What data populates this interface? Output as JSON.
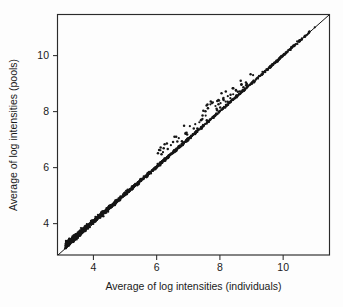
{
  "figure": {
    "background_color": "#fdfdfd",
    "ink_color": "#1a1a1a"
  },
  "chart_data": {
    "type": "scatter",
    "title": "",
    "xlabel": "Average of log intensities (individuals)",
    "ylabel": "Average of log intensities (pools)",
    "xlim": [
      2.88,
      11.45
    ],
    "ylim": [
      2.88,
      11.45
    ],
    "xticks": [
      4,
      6,
      8,
      10
    ],
    "yticks": [
      4,
      6,
      8,
      10
    ],
    "xtick_labels": [
      "4",
      "6",
      "8",
      "10"
    ],
    "ytick_labels": [
      "4",
      "6",
      "8",
      "10"
    ],
    "grid": false,
    "legend": null,
    "point_color": "#161616",
    "point_size": 1.1,
    "reference_line": {
      "name": "identity-line",
      "slope": 1,
      "intercept": 0,
      "x_from": 2.88,
      "x_to": 11.45,
      "color": "#111111"
    },
    "series": [
      {
        "name": "probes",
        "n_points": 1400,
        "points": [
          [
            3.1,
            3.12
          ],
          [
            3.18,
            3.2
          ],
          [
            3.25,
            3.28
          ],
          [
            3.32,
            3.35
          ],
          [
            3.38,
            3.41
          ],
          [
            3.44,
            3.47
          ],
          [
            3.5,
            3.54
          ],
          [
            3.55,
            3.6
          ],
          [
            3.6,
            3.66
          ],
          [
            3.64,
            3.71
          ],
          [
            3.68,
            3.75
          ],
          [
            3.72,
            3.8
          ],
          [
            3.75,
            3.84
          ],
          [
            3.78,
            3.88
          ],
          [
            3.81,
            3.91
          ],
          [
            3.84,
            3.94
          ],
          [
            3.87,
            3.97
          ],
          [
            3.9,
            4.0
          ],
          [
            3.93,
            4.03
          ],
          [
            3.96,
            4.06
          ],
          [
            3.99,
            4.09
          ],
          [
            4.02,
            4.12
          ],
          [
            4.05,
            4.15
          ],
          [
            4.08,
            4.18
          ],
          [
            4.11,
            4.21
          ],
          [
            4.14,
            4.24
          ],
          [
            4.17,
            4.27
          ],
          [
            4.2,
            4.3
          ],
          [
            4.23,
            4.33
          ],
          [
            4.26,
            4.36
          ],
          [
            4.29,
            4.39
          ],
          [
            4.32,
            4.42
          ],
          [
            4.35,
            4.45
          ],
          [
            4.38,
            4.48
          ],
          [
            4.41,
            4.51
          ],
          [
            4.44,
            4.54
          ],
          [
            4.47,
            4.56
          ],
          [
            4.5,
            4.59
          ],
          [
            4.53,
            4.62
          ],
          [
            4.56,
            4.65
          ],
          [
            4.59,
            4.68
          ],
          [
            4.62,
            4.71
          ],
          [
            4.65,
            4.74
          ],
          [
            4.68,
            4.77
          ],
          [
            4.71,
            4.8
          ],
          [
            4.74,
            4.82
          ],
          [
            4.77,
            4.85
          ],
          [
            4.8,
            4.88
          ],
          [
            4.83,
            4.91
          ],
          [
            4.86,
            4.94
          ],
          [
            4.9,
            4.97
          ],
          [
            4.94,
            5.01
          ],
          [
            4.98,
            5.05
          ],
          [
            5.02,
            5.09
          ],
          [
            5.06,
            5.13
          ],
          [
            5.1,
            5.17
          ],
          [
            5.14,
            5.21
          ],
          [
            5.18,
            5.25
          ],
          [
            5.22,
            5.29
          ],
          [
            5.26,
            5.33
          ],
          [
            5.3,
            5.37
          ],
          [
            5.35,
            5.42
          ],
          [
            5.4,
            5.47
          ],
          [
            5.45,
            5.52
          ],
          [
            5.5,
            5.56
          ],
          [
            5.55,
            5.61
          ],
          [
            5.6,
            5.66
          ],
          [
            5.65,
            5.71
          ],
          [
            5.7,
            5.76
          ],
          [
            5.75,
            5.81
          ],
          [
            5.8,
            5.85
          ],
          [
            5.86,
            5.91
          ],
          [
            5.92,
            5.97
          ],
          [
            5.98,
            6.03
          ],
          [
            6.04,
            6.09
          ],
          [
            6.1,
            6.14
          ],
          [
            6.16,
            6.2
          ],
          [
            6.22,
            6.26
          ],
          [
            6.28,
            6.32
          ],
          [
            6.34,
            6.38
          ],
          [
            6.4,
            6.44
          ],
          [
            6.47,
            6.51
          ],
          [
            6.54,
            6.58
          ],
          [
            6.61,
            6.65
          ],
          [
            6.68,
            6.71
          ],
          [
            6.75,
            6.78
          ],
          [
            6.82,
            6.85
          ],
          [
            6.9,
            6.93
          ],
          [
            6.98,
            7.0
          ],
          [
            7.06,
            7.08
          ],
          [
            7.14,
            7.16
          ],
          [
            7.22,
            7.24
          ],
          [
            7.3,
            7.32
          ],
          [
            7.4,
            7.42
          ],
          [
            7.5,
            7.52
          ],
          [
            7.6,
            7.62
          ],
          [
            7.7,
            7.72
          ],
          [
            7.8,
            7.82
          ],
          [
            7.9,
            7.92
          ],
          [
            8.0,
            8.02
          ],
          [
            8.1,
            8.12
          ],
          [
            8.2,
            8.22
          ],
          [
            8.3,
            8.32
          ],
          [
            8.4,
            8.42
          ],
          [
            8.5,
            8.52
          ],
          [
            8.6,
            8.62
          ],
          [
            8.7,
            8.72
          ],
          [
            8.85,
            8.87
          ],
          [
            9.0,
            9.02
          ],
          [
            9.2,
            9.22
          ],
          [
            9.4,
            9.41
          ],
          [
            9.6,
            9.61
          ],
          [
            9.85,
            9.86
          ],
          [
            10.1,
            10.11
          ],
          [
            10.4,
            10.41
          ],
          [
            10.7,
            10.71
          ],
          [
            11.0,
            11.01
          ],
          [
            6.12,
            6.62
          ],
          [
            6.2,
            6.55
          ],
          [
            6.45,
            6.8
          ],
          [
            6.7,
            7.05
          ],
          [
            6.95,
            7.25
          ],
          [
            7.05,
            7.48
          ],
          [
            7.22,
            7.55
          ],
          [
            7.35,
            7.62
          ],
          [
            7.45,
            7.74
          ],
          [
            7.55,
            7.86
          ],
          [
            7.62,
            8.12
          ],
          [
            7.7,
            8.26
          ],
          [
            7.78,
            8.33
          ],
          [
            7.86,
            8.2
          ],
          [
            7.95,
            8.42
          ],
          [
            8.02,
            8.3
          ],
          [
            8.1,
            8.45
          ],
          [
            8.18,
            8.36
          ],
          [
            8.25,
            8.55
          ],
          [
            8.33,
            8.48
          ],
          [
            8.42,
            8.62
          ],
          [
            8.52,
            8.58
          ],
          [
            8.62,
            8.72
          ],
          [
            8.72,
            8.78
          ],
          [
            9.05,
            9.3
          ]
        ]
      }
    ]
  }
}
